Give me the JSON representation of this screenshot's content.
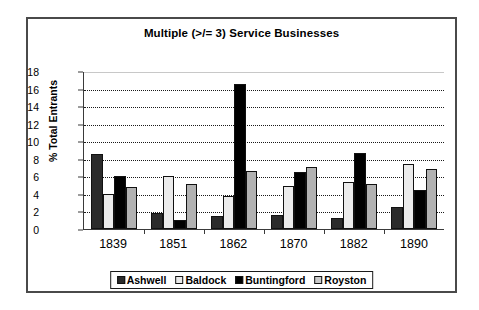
{
  "chart_data": {
    "type": "bar",
    "title": "Multiple (>/= 3) Service Businesses",
    "xlabel": "",
    "ylabel": "% Total Entrants",
    "ylim": [
      0,
      18
    ],
    "ytick_step": 2,
    "yticks": [
      18,
      16,
      14,
      12,
      10,
      8,
      6,
      4,
      2,
      0
    ],
    "grid": true,
    "grid_orientation": "horizontal",
    "legend_position": "bottom",
    "categories": [
      "1839",
      "1851",
      "1862",
      "1870",
      "1882",
      "1890"
    ],
    "series": [
      {
        "name": "Ashwell",
        "color": "#2b2b2b",
        "values": [
          8.5,
          1.8,
          1.5,
          1.6,
          1.3,
          2.5
        ]
      },
      {
        "name": "Baldock",
        "color": "#ebebeb",
        "values": [
          4.0,
          6.0,
          3.8,
          4.9,
          5.3,
          7.4
        ]
      },
      {
        "name": "Buntingford",
        "color": "#000000",
        "values": [
          6.0,
          1.0,
          16.5,
          6.5,
          8.7,
          4.5
        ]
      },
      {
        "name": "Royston",
        "color": "#b2b2b2",
        "values": [
          4.8,
          5.1,
          6.6,
          7.1,
          5.1,
          6.8
        ]
      }
    ]
  },
  "frame": {
    "border_color": "#4a4a4a"
  }
}
